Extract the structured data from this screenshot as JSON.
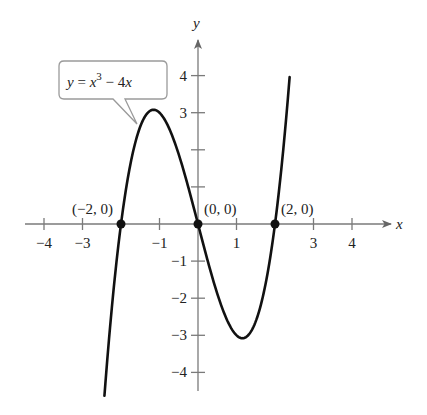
{
  "chart_data": {
    "type": "line",
    "title": "",
    "function": "y = x^3 - 4x",
    "xlabel": "x",
    "ylabel": "y",
    "xlim": [
      -4.5,
      5
    ],
    "ylim": [
      -4.5,
      5
    ],
    "grid": false,
    "x_ticks": [
      -4,
      -3,
      -1,
      1,
      3,
      4
    ],
    "x_tick_labels": [
      "−4",
      "−3",
      "−1",
      "1",
      "3",
      "4"
    ],
    "x_minor_ticks": [
      -4,
      -3,
      -2,
      -1,
      1,
      2,
      3,
      4
    ],
    "y_ticks": [
      -4,
      -3,
      -2,
      -1,
      3,
      4
    ],
    "y_tick_labels": [
      "−4",
      "−3",
      "−2",
      "−1",
      "3",
      "4"
    ],
    "y_minor_ticks": [
      -4,
      -3,
      -2,
      -1,
      1,
      2,
      3,
      4
    ],
    "series": [
      {
        "name": "y = x^3 - 4x",
        "x_range": [
          -2.43,
          2.38
        ],
        "points": [
          [
            -2.4,
            -4.22
          ],
          [
            -2.0,
            0
          ],
          [
            -1.5,
            2.63
          ],
          [
            -1.155,
            3.08
          ],
          [
            -1.0,
            3.0
          ],
          [
            -0.5,
            1.88
          ],
          [
            0,
            0
          ],
          [
            0.5,
            -1.88
          ],
          [
            1.0,
            -3.0
          ],
          [
            1.155,
            -3.08
          ],
          [
            1.5,
            -2.63
          ],
          [
            2.0,
            0
          ],
          [
            2.38,
            3.96
          ]
        ]
      }
    ],
    "annotations": [
      {
        "text": "(−2, 0)",
        "x": -2,
        "y": 0
      },
      {
        "text": "(0, 0)",
        "x": 0,
        "y": 0
      },
      {
        "text": "(2, 0)",
        "x": 2,
        "y": 0
      }
    ],
    "callout": {
      "text_lhs": "y",
      "text_eq": " = ",
      "text_x": "x",
      "text_exp": "3",
      "text_rest": " − 4",
      "text_x2": "x"
    },
    "colors": {
      "curve": "#111111",
      "axis": "#777777",
      "callout_border": "#9a9a9a"
    }
  }
}
